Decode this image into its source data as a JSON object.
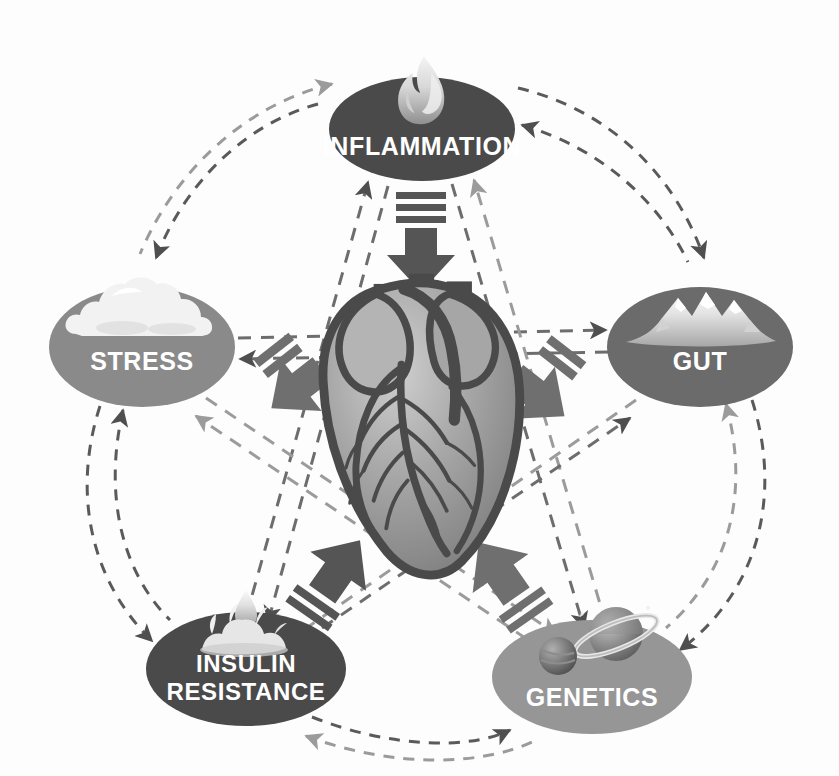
{
  "diagram": {
    "center": {
      "name": "heart",
      "icon": "anatomical-heart-icon",
      "label": ""
    },
    "palette": {
      "background": "#fdfdfd",
      "node_dark": "#4a4a4a",
      "node_mid_dark": "#5e5e5e",
      "node_mid": "#8a8a8a",
      "node_light": "#969696",
      "arrow_dark": "#555555",
      "arrow_mid": "#6f6f6f",
      "dashed_dark": "#5a5a5a",
      "dashed_light": "#9b9b9b",
      "label_text": "#ffffff",
      "heart_body": "#9a9a9a",
      "heart_outline": "#4a4a4a",
      "heart_highlight": "#c9c9c9"
    },
    "nodes": [
      {
        "id": "inflammation",
        "label": "INFLAMMATION",
        "lines": [
          "INFLAMMATION"
        ],
        "icon": "flame-icon",
        "color": "#4a4a4a",
        "cx": 422,
        "cy": 129,
        "rx": 93,
        "ry": 52
      },
      {
        "id": "stress",
        "label": "STRESS",
        "lines": [
          "STRESS"
        ],
        "icon": "cloud-icon",
        "color": "#8a8a8a",
        "cx": 142,
        "cy": 347,
        "rx": 93,
        "ry": 60
      },
      {
        "id": "gut",
        "label": "GUT",
        "lines": [
          "GUT"
        ],
        "icon": "mountain-icon",
        "color": "#6b6b6b",
        "cx": 700,
        "cy": 347,
        "rx": 93,
        "ry": 60
      },
      {
        "id": "insulin_resistance",
        "label": "INSULIN RESISTANCE",
        "lines": [
          "INSULIN",
          "RESISTANCE"
        ],
        "icon": "water-droplet-splash-icon",
        "color": "#4a4a4a",
        "cx": 246,
        "cy": 669,
        "rx": 100,
        "ry": 57
      },
      {
        "id": "genetics",
        "label": "GENETICS",
        "lines": [
          "GENETICS"
        ],
        "icon": "planets-icon",
        "color": "#969696",
        "cx": 592,
        "cy": 677,
        "rx": 100,
        "ry": 57
      }
    ],
    "center_arrows": [
      {
        "id": "inflammation-to-heart",
        "from": "inflammation",
        "to": "heart",
        "direction": "down",
        "style": "block-arrow-with-motion-lines"
      },
      {
        "id": "stress-to-heart",
        "from": "stress",
        "to": "heart",
        "direction": "down-right",
        "style": "block-arrow-with-motion-lines"
      },
      {
        "id": "gut-to-heart",
        "from": "gut",
        "to": "heart",
        "direction": "down-left",
        "style": "block-arrow-with-motion-lines"
      },
      {
        "id": "insulin-resistance-to-heart",
        "from": "insulin_resistance",
        "to": "heart",
        "direction": "up-right",
        "style": "block-arrow-with-motion-lines"
      },
      {
        "id": "genetics-to-heart",
        "from": "genetics",
        "to": "heart",
        "direction": "up-left",
        "style": "block-arrow-with-motion-lines"
      }
    ],
    "ring_connections": [
      {
        "id": "inflammation-stress",
        "from": "inflammation",
        "to": "stress",
        "style": "dashed-arc-bidirectional"
      },
      {
        "id": "inflammation-gut",
        "from": "inflammation",
        "to": "gut",
        "style": "dashed-arc-bidirectional"
      },
      {
        "id": "stress-insulin-resistance",
        "from": "stress",
        "to": "insulin_resistance",
        "style": "dashed-arc-bidirectional"
      },
      {
        "id": "gut-genetics",
        "from": "gut",
        "to": "genetics",
        "style": "dashed-arc-bidirectional"
      },
      {
        "id": "insulin-resistance-genetics",
        "from": "insulin_resistance",
        "to": "genetics",
        "style": "dashed-arc-bidirectional"
      }
    ],
    "star_connections": [
      {
        "id": "stress-gut",
        "from": "stress",
        "to": "gut",
        "style": "dashed-line-bidirectional"
      },
      {
        "id": "inflammation-insulin-resistance",
        "from": "inflammation",
        "to": "insulin_resistance",
        "style": "dashed-line-bidirectional"
      },
      {
        "id": "inflammation-genetics",
        "from": "inflammation",
        "to": "genetics",
        "style": "dashed-line-bidirectional"
      },
      {
        "id": "stress-genetics",
        "from": "stress",
        "to": "genetics",
        "style": "dashed-line-bidirectional"
      },
      {
        "id": "gut-insulin-resistance",
        "from": "gut",
        "to": "insulin_resistance",
        "style": "dashed-line-bidirectional"
      }
    ]
  }
}
